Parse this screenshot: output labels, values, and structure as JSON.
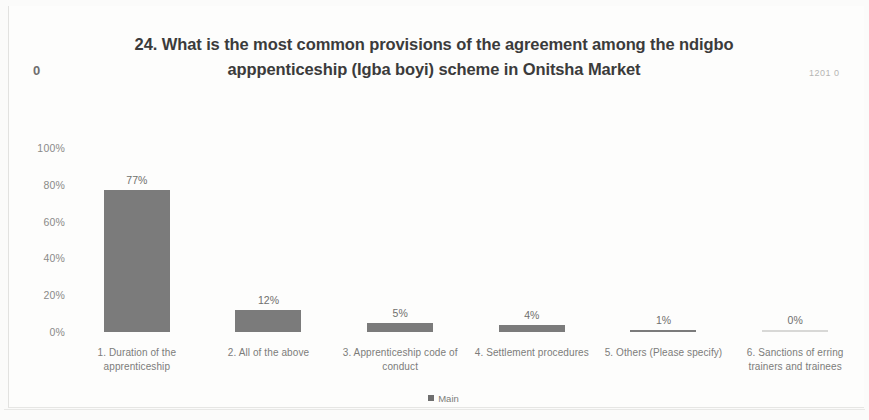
{
  "chart_data": {
    "type": "bar",
    "title": "24. What is the most common provisions of the agreement among the ndigbo apppenticeship (Igba boyi) scheme in Onitsha Market",
    "categories": [
      "1. Duration of the apprenticeship",
      "2. All of the above",
      "3. Apprenticeship code of conduct",
      "4. Settlement procedures",
      "5. Others (Please specify)",
      "6. Sanctions of erring trainers and trainees"
    ],
    "values": [
      77,
      12,
      5,
      4,
      1,
      0
    ],
    "data_labels": [
      "77%",
      "12%",
      "5%",
      "4%",
      "1%",
      "0%"
    ],
    "series": [
      {
        "name": "Main",
        "values": [
          77,
          12,
          5,
          4,
          1,
          0
        ]
      }
    ],
    "xlabel": "",
    "ylabel": "",
    "ylim": [
      0,
      100
    ],
    "ytick_labels": [
      "100%",
      "80%",
      "60%",
      "40%",
      "20%",
      "0%"
    ],
    "ytick_values": [
      100,
      80,
      60,
      40,
      20,
      0
    ],
    "grid": false,
    "legend_position": "bottom",
    "bar_color": "#7b7b7b",
    "text_color": "#7c7c7a",
    "title_color": "#3b3b3b",
    "background": "#fdfdfc"
  },
  "legend": {
    "entries": [
      {
        "label": "Main",
        "color": "#6f6f6f"
      }
    ]
  },
  "artifacts": {
    "stray_zero": "0",
    "stray_right_text": "1201 0"
  }
}
